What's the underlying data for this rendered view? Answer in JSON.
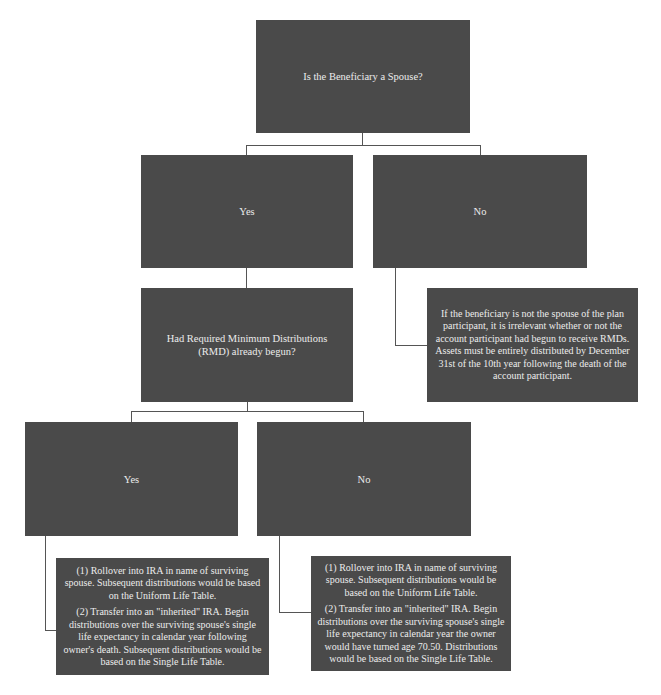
{
  "diagram": {
    "type": "decision-tree",
    "root": {
      "question": "Is the Beneficiary a Spouse?"
    },
    "spouse_branch": {
      "yes_label": "Yes",
      "no_label": "No",
      "no_outcome": "If the beneficiary is not the spouse of the plan participant, it is irrelevant whether or not the account participant had begun to receive RMDs. Assets must be entirely distributed by December 31st of the 10th year following the death of the account participant."
    },
    "rmd_question": {
      "question": "Had Required Minimum Distributions (RMD) already begun?"
    },
    "rmd_branch": {
      "yes_label": "Yes",
      "no_label": "No",
      "yes_outcome": {
        "option1": "(1) Rollover into IRA in name of surviving spouse. Subsequent distributions would be based on the Uniform Life Table.",
        "option2": "(2) Transfer into an \"inherited\" IRA. Begin distributions over the surviving spouse's single life expectancy in calendar year following owner's death. Subsequent distributions would be based on the Single Life Table."
      },
      "no_outcome": {
        "option1": "(1) Rollover into IRA in name of surviving spouse. Subsequent distributions would be based on the Uniform Life Table.",
        "option2": "(2) Transfer into an \"inherited\" IRA. Begin distributions over the surviving spouse's single life expectancy in calendar year the owner would have turned age 70.50. Distributions would be based on the Single Life Table."
      }
    },
    "colors": {
      "box_fill": "#4a4a4a",
      "box_text": "#ececec",
      "connector": "#555555",
      "background": "#ffffff"
    }
  }
}
